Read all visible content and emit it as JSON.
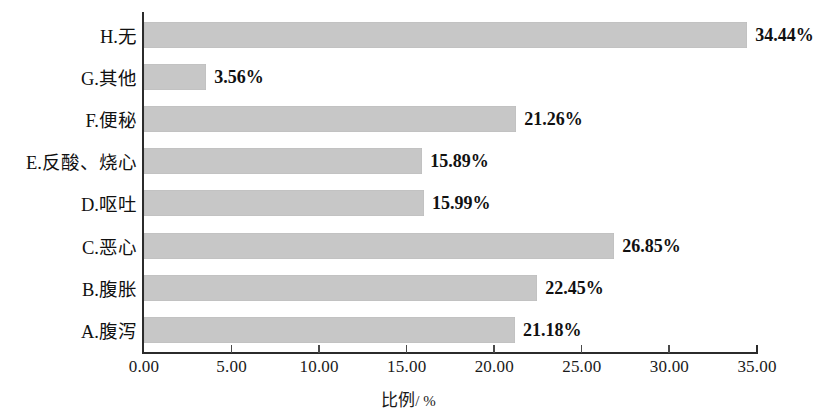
{
  "chart_data": {
    "type": "bar",
    "orientation": "horizontal",
    "title": "",
    "subtitle": "",
    "xlabel": "比例 / %",
    "xlabel_text": "比例",
    "xlabel_unit": "/ %",
    "ylabel": "",
    "xlim": [
      0,
      35
    ],
    "xticks": [
      "0.00",
      "5.00",
      "10.00",
      "15.00",
      "20.00",
      "25.00",
      "30.00",
      "35.00"
    ],
    "xtick_values": [
      0,
      5,
      10,
      15,
      20,
      25,
      30,
      35
    ],
    "grid": false,
    "legend": false,
    "bar_color": "#c7c7c7",
    "axis_color": "#2b2b2b",
    "text_color": "#111111",
    "categories": [
      "H.无",
      "G.其他",
      "F.便秘",
      "E.反酸、烧心",
      "D.呕吐",
      "C.恶心",
      "B.腹胀",
      "A.腹泻"
    ],
    "values": [
      34.44,
      3.56,
      21.26,
      15.89,
      15.99,
      26.85,
      22.45,
      21.18
    ],
    "value_labels": [
      "34.44%",
      "3.56%",
      "21.26%",
      "15.89%",
      "15.99%",
      "26.85%",
      "22.45%",
      "21.18%"
    ],
    "bars": [
      {
        "category": "H.无",
        "value": 34.44,
        "label": "34.44%"
      },
      {
        "category": "G.其他",
        "value": 3.56,
        "label": "3.56%"
      },
      {
        "category": "F.便秘",
        "value": 21.26,
        "label": "21.26%"
      },
      {
        "category": "E.反酸、烧心",
        "value": 15.89,
        "label": "15.89%"
      },
      {
        "category": "D.呕吐",
        "value": 15.99,
        "label": "15.99%"
      },
      {
        "category": "C.恶心",
        "value": 26.85,
        "label": "26.85%"
      },
      {
        "category": "B.腹胀",
        "value": 22.45,
        "label": "22.45%"
      },
      {
        "category": "A.腹泻",
        "value": 21.18,
        "label": "21.18%"
      }
    ]
  }
}
